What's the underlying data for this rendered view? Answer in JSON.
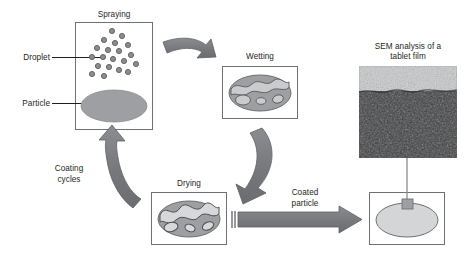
{
  "diagram": {
    "colors": {
      "text": "#231f20",
      "box_border": "#6f7072",
      "arrow_fill": "#7b7c7e",
      "arrow_stroke": "#58595b",
      "particle_fill": "#9d9fa2",
      "particle_stroke": "#6f7072",
      "droplet_fill": "#8a8c8f",
      "droplet_stroke": "#5e5f61",
      "film_light": "#c9cbcd",
      "sem_film": "#b9bbbd",
      "sem_core": "#3f4042",
      "coated_fill": "#d3d5d7"
    }
  },
  "labels": {
    "droplet": "Droplet",
    "particle": "Particle",
    "spraying": "Spraying",
    "wetting": "Wetting",
    "drying": "Drying",
    "coating_cycles_line1": "Coating",
    "coating_cycles_line2": "cycles",
    "coated_particle_line1": "Coated",
    "coated_particle_line2": "particle",
    "sem_line1": "SEM analysis of a",
    "sem_line2": "tablet film"
  },
  "stages": [
    {
      "id": "spraying",
      "label": "Spraying",
      "description": "Droplets sprayed onto a bare particle"
    },
    {
      "id": "wetting",
      "label": "Wetting",
      "description": "Droplets spread and wet the particle surface"
    },
    {
      "id": "drying",
      "label": "Drying",
      "description": "Solvent evaporates leaving film patches"
    },
    {
      "id": "coated",
      "label": "Coated particle",
      "description": "Particle with a uniform dry film"
    }
  ],
  "droplets": [
    {
      "x": 112,
      "y": 31,
      "r": 2.6
    },
    {
      "x": 122,
      "y": 36,
      "r": 2.6
    },
    {
      "x": 104,
      "y": 40,
      "r": 2.6
    },
    {
      "x": 115,
      "y": 43,
      "r": 2.6
    },
    {
      "x": 128,
      "y": 45,
      "r": 2.6
    },
    {
      "x": 97,
      "y": 48,
      "r": 2.6
    },
    {
      "x": 108,
      "y": 50,
      "r": 2.6
    },
    {
      "x": 119,
      "y": 51,
      "r": 2.6
    },
    {
      "x": 92,
      "y": 57,
      "r": 2.6
    },
    {
      "x": 103,
      "y": 57,
      "r": 2.6
    },
    {
      "x": 113,
      "y": 59,
      "r": 2.6
    },
    {
      "x": 131,
      "y": 55,
      "r": 2.6
    },
    {
      "x": 124,
      "y": 61,
      "r": 2.6
    },
    {
      "x": 98,
      "y": 66,
      "r": 2.6
    },
    {
      "x": 109,
      "y": 67,
      "r": 2.6
    },
    {
      "x": 136,
      "y": 64,
      "r": 2.6
    },
    {
      "x": 119,
      "y": 70,
      "r": 2.6
    },
    {
      "x": 92,
      "y": 74,
      "r": 2.6
    },
    {
      "x": 104,
      "y": 76,
      "r": 2.6
    },
    {
      "x": 128,
      "y": 72,
      "r": 2.6
    }
  ],
  "sem": {
    "film_label": "film layer",
    "core_label": "tablet core"
  }
}
